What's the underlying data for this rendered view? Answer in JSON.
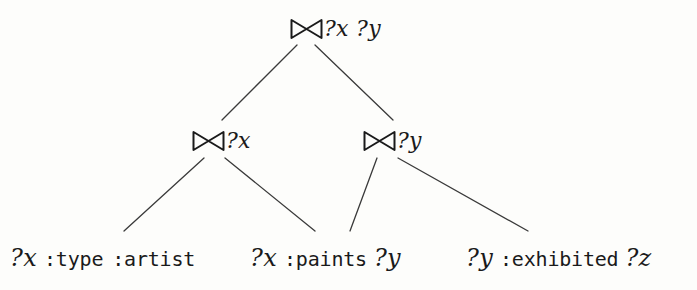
{
  "figure": {
    "type": "query-plan-tree",
    "join_symbol": "join-bowtie-icon",
    "stroke_color": "#3a3a3a",
    "text_color": "#1a1a1a",
    "background_color": "#fdfdfb"
  },
  "nodes": {
    "root": {
      "id": "root-join",
      "operator": "⋈",
      "variables": "?x ?y",
      "x": 290,
      "y": 14
    },
    "left_join": {
      "id": "left-join",
      "operator": "⋈",
      "variables": "?x",
      "x": 192,
      "y": 126
    },
    "right_join": {
      "id": "right-join",
      "operator": "⋈",
      "variables": "?y",
      "x": 363,
      "y": 126
    }
  },
  "leaves": [
    {
      "id": "leaf-type-artist",
      "subject": "?x",
      "predicate": ":type",
      "object": ":artist",
      "x": 10
    },
    {
      "id": "leaf-paints",
      "subject": "?x",
      "predicate": ":paints",
      "object": "?y",
      "x": 250
    },
    {
      "id": "leaf-exhibited",
      "subject": "?y",
      "predicate": ":exhibited",
      "object": "?z",
      "x": 466
    }
  ],
  "edges": [
    {
      "id": "edge-root-left",
      "x1": 297,
      "y1": 45,
      "x2": 222,
      "y2": 120
    },
    {
      "id": "edge-root-right",
      "x1": 315,
      "y1": 45,
      "x2": 393,
      "y2": 120
    },
    {
      "id": "edge-left-leaf1",
      "x1": 204,
      "y1": 158,
      "x2": 124,
      "y2": 231
    },
    {
      "id": "edge-left-leaf2",
      "x1": 225,
      "y1": 158,
      "x2": 315,
      "y2": 231
    },
    {
      "id": "edge-right-leaf2",
      "x1": 377,
      "y1": 158,
      "x2": 350,
      "y2": 231
    },
    {
      "id": "edge-right-leaf3",
      "x1": 398,
      "y1": 158,
      "x2": 528,
      "y2": 231
    }
  ]
}
